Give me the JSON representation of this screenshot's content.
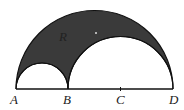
{
  "diagram": {
    "points": [
      {
        "id": "A",
        "label": "A"
      },
      {
        "id": "B",
        "label": "B"
      },
      {
        "id": "C",
        "label": "C"
      },
      {
        "id": "D",
        "label": "D"
      }
    ],
    "region_label": "R",
    "colors": {
      "shade": "#3a3a3a",
      "stroke": "#111111",
      "background": "#ffffff"
    }
  }
}
